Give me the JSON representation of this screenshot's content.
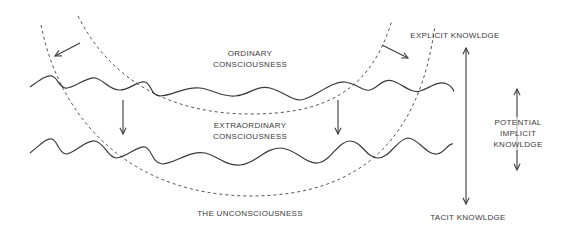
{
  "diagram": {
    "labels": {
      "ordinary_line1": "ORDINARY",
      "ordinary_line2": "CONSCIOUSNESS",
      "extraordinary_line1": "EXTRAORDINARY",
      "extraordinary_line2": "CONSCIOUSNESS",
      "unconsciousness": "THE UNCONSCIOUSNESS",
      "explicit": "EXPLICIT KNOWLDGE",
      "tacit": "TACIT KNOWLDGE",
      "potential_line1": "POTENTIAL",
      "potential_line2": "IMPLICIT",
      "potential_line3": "KNOWLDGE"
    },
    "elements": {
      "outer_arc": "dashed semicircular boundary (unconsciousness)",
      "inner_arc": "dashed semicircular boundary (extraordinary consciousness)",
      "upper_wave": "wavy line (ordinary consciousness level)",
      "lower_wave": "wavy line (extraordinary consciousness level)",
      "arrows": [
        "left-outward arrow",
        "right-outward arrow",
        "left-down arrow",
        "right-down arrow",
        "explicit-tacit double arrow",
        "potential-implicit double arrow"
      ]
    },
    "colors": {
      "line": "#3a3a3a",
      "background": "#ffffff"
    }
  }
}
